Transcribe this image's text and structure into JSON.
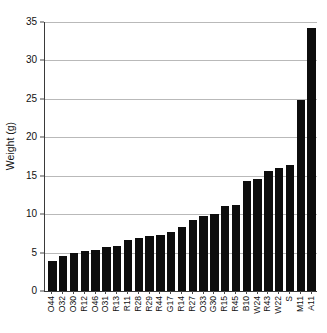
{
  "chart_data": {
    "type": "bar",
    "title": "",
    "xlabel": "",
    "ylabel": "Weight (g)",
    "ylim": [
      0,
      35
    ],
    "yticks": [
      0,
      5,
      10,
      15,
      20,
      25,
      30,
      35
    ],
    "ytick_labels": [
      "0",
      "5",
      "10",
      "15",
      "20",
      "25",
      "30",
      "35"
    ],
    "grid": "horizontal",
    "legend": "none",
    "bar_color": "#0d0d0d",
    "categories": [
      "O44",
      "O32",
      "O30",
      "R12",
      "O46",
      "O31",
      "R13",
      "R11",
      "R28",
      "R29",
      "R44",
      "G17",
      "R14",
      "R27",
      "O33",
      "G30",
      "R15",
      "R45",
      "B10",
      "W24",
      "R43",
      "W22",
      "S",
      "M11",
      "A11"
    ],
    "values": [
      3.9,
      4.6,
      4.9,
      5.2,
      5.4,
      5.7,
      5.9,
      6.6,
      6.9,
      7.1,
      7.3,
      7.7,
      8.3,
      9.3,
      9.8,
      10.0,
      11.0,
      11.2,
      14.3,
      14.6,
      15.6,
      16.0,
      16.4,
      24.8,
      34.2
    ]
  }
}
